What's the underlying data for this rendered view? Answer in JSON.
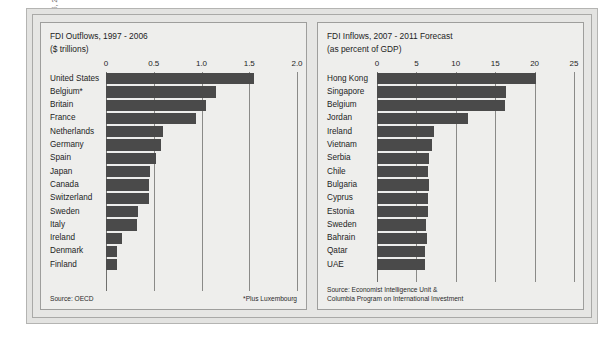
{
  "credit": "FDI outflows, Economist June 30, 2007, 110; FDI inflow forecasts, Economist September 15, 2007, 121.",
  "colors": {
    "bar": "#4a4a4a",
    "panel_bg": "#eeeeec",
    "frame": "#e3e3e1",
    "grid": "#8a8a88"
  },
  "left_panel": {
    "title": "FDI Outflows, 1997 - 2006",
    "subtitle": "($ trillions)",
    "source": "Source: OECD",
    "note": "*Plus Luxembourg"
  },
  "right_panel": {
    "title": "FDI Inflows, 2007 - 2011 Forecast",
    "subtitle": "(as percent of GDP)",
    "source": "Source: Economist Intelligence Unit &\nColumbia Program on International Investment"
  },
  "chart_data": [
    {
      "type": "bar",
      "orientation": "horizontal",
      "title": "FDI Outflows, 1997 - 2006",
      "subtitle": "($ trillions)",
      "xlabel": "$ trillions",
      "ylabel": "",
      "xlim": [
        0,
        2.0
      ],
      "xticks": [
        0,
        0.5,
        1.0,
        1.5,
        2.0
      ],
      "xtick_labels": [
        "0",
        "0.5",
        "1.0",
        "1.5",
        "2.0"
      ],
      "grid": true,
      "legend": false,
      "source": "Source: OECD",
      "note": "*Plus Luxembourg",
      "categories": [
        "United States",
        "Belgium*",
        "Britain",
        "France",
        "Netherlands",
        "Germany",
        "Spain",
        "Japan",
        "Canada",
        "Switzerland",
        "Sweden",
        "Italy",
        "Ireland",
        "Denmark",
        "Finland"
      ],
      "values": [
        1.55,
        1.15,
        1.05,
        0.94,
        0.6,
        0.58,
        0.52,
        0.46,
        0.45,
        0.45,
        0.33,
        0.32,
        0.17,
        0.12,
        0.11
      ]
    },
    {
      "type": "bar",
      "orientation": "horizontal",
      "title": "FDI Inflows, 2007 - 2011 Forecast",
      "subtitle": "(as percent of GDP)",
      "xlabel": "percent of GDP",
      "ylabel": "",
      "xlim": [
        0,
        25
      ],
      "xticks": [
        0,
        5,
        10,
        15,
        20,
        25
      ],
      "xtick_labels": [
        "0",
        "5",
        "10",
        "15",
        "20",
        "25"
      ],
      "grid": true,
      "legend": false,
      "source": "Source: Economist Intelligence Unit &\nColumbia Program on International Investment",
      "categories": [
        "Hong Kong",
        "Singapore",
        "Belgium",
        "Jordan",
        "Ireland",
        "Vietnam",
        "Serbia",
        "Chile",
        "Bulgaria",
        "Cyprus",
        "Estonia",
        "Sweden",
        "Bahrain",
        "Qatar",
        "UAE"
      ],
      "values": [
        20.2,
        16.4,
        16.3,
        11.5,
        7.2,
        7.0,
        6.6,
        6.5,
        6.6,
        6.5,
        6.5,
        6.2,
        6.3,
        6.1,
        6.1
      ]
    }
  ]
}
